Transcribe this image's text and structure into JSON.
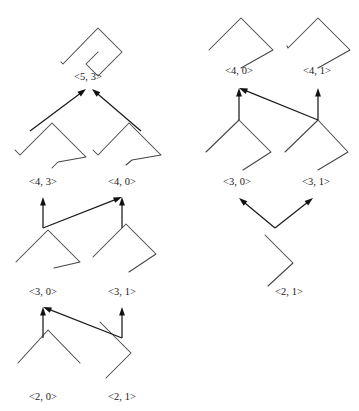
{
  "figure": {
    "kind": "derivation-diagram",
    "background_color": "#ffffff",
    "curve_color": "#454545",
    "arrow_color": "#111111",
    "label_color": "#1a1a1a",
    "columns": [
      {
        "name": "left-column",
        "description": "derivation chain from <2, 0> and <2, 1> up to <5, 3>"
      },
      {
        "name": "right-column",
        "description": "derivation chain from <2, 1> up to <4, 0> and <4, 1>"
      }
    ],
    "nodes": [
      {
        "id": "L53",
        "label": "<5, 3>",
        "label_x": 88,
        "label_y": 80,
        "column": "left",
        "level": 5
      },
      {
        "id": "L43",
        "label": "<4, 3>",
        "label_x": 43,
        "label_y": 185,
        "column": "left",
        "level": 4
      },
      {
        "id": "L40",
        "label": "<4, 0>",
        "label_x": 122,
        "label_y": 185,
        "column": "left",
        "level": 4
      },
      {
        "id": "L30",
        "label": "<3, 0>",
        "label_x": 43,
        "label_y": 295,
        "column": "left",
        "level": 3
      },
      {
        "id": "L31",
        "label": "<3, 1>",
        "label_x": 122,
        "label_y": 295,
        "column": "left",
        "level": 3
      },
      {
        "id": "L20",
        "label": "<2, 0>",
        "label_x": 43,
        "label_y": 400,
        "column": "left",
        "level": 2
      },
      {
        "id": "L21",
        "label": "<2, 1>",
        "label_x": 122,
        "label_y": 400,
        "column": "left",
        "level": 2
      },
      {
        "id": "R40",
        "label": "<4, 0>",
        "label_x": 239,
        "label_y": 74,
        "column": "right",
        "level": 4
      },
      {
        "id": "R41",
        "label": "<4, 1>",
        "label_x": 317,
        "label_y": 74,
        "column": "right",
        "level": 4
      },
      {
        "id": "R30",
        "label": "<3, 0>",
        "label_x": 237,
        "label_y": 185,
        "column": "right",
        "level": 3
      },
      {
        "id": "R31",
        "label": "<3, 1>",
        "label_x": 316,
        "label_y": 185,
        "column": "right",
        "level": 3
      },
      {
        "id": "R21",
        "label": "<2, 1>",
        "label_x": 289,
        "label_y": 295,
        "column": "right",
        "level": 2
      }
    ],
    "curves": [
      {
        "id": "L53",
        "points": "61,62 63,64 98,28 122,52 98,76 86,64 98,52"
      },
      {
        "id": "L43",
        "points": "15,150 20,155 52,123 86,157 58,162 52,168"
      },
      {
        "id": "L40",
        "points": "93,150 98,155 129,123 161,155 132,160 126,165"
      },
      {
        "id": "L30",
        "points": "16,262 48,230 80,262 54,268"
      },
      {
        "id": "L31",
        "points": "93,257 126,224 156,254 129,272"
      },
      {
        "id": "L20",
        "points": "18,363 48,330 80,363"
      },
      {
        "id": "L21",
        "points": "100,322 131,353 106,378"
      },
      {
        "id": "R40",
        "points": "209,50 241,18 273,50 241,68"
      },
      {
        "id": "R41",
        "points": "287,46 288,48 318,18 350,50 318,68"
      },
      {
        "id": "R30",
        "points": "206,152 239,120 271,152 243,170"
      },
      {
        "id": "R31",
        "points": "285,152 318,120 348,152 318,170"
      },
      {
        "id": "R21",
        "points": "265,235 293,263 268,286"
      }
    ],
    "arrows": [
      {
        "id": "a1",
        "from": "L43",
        "to": "L53",
        "path": "30,131 86,89",
        "desc": "left branch into <5, 3>"
      },
      {
        "id": "a2",
        "from": "L40",
        "to": "L53",
        "path": "141,131 92,89",
        "desc": "right branch into <5, 3>"
      },
      {
        "id": "a3",
        "from": "L30",
        "to": "L43",
        "path": "43,228 43,197",
        "desc": "vertical into <4, 3>"
      },
      {
        "id": "a4",
        "from": "L30",
        "to": "L40",
        "path": "43,228 122,197",
        "desc": "diagonal into <4, 0>"
      },
      {
        "id": "a5",
        "from": "L31",
        "to": "L40",
        "path": "122,228 122,197",
        "desc": "vertical into <4, 0>"
      },
      {
        "id": "a6",
        "from": "L20",
        "to": "L30",
        "path": "43,338 43,307",
        "desc": "vertical into <3, 0>"
      },
      {
        "id": "a7",
        "from": "L21",
        "to": "L30",
        "path": "122,338 43,307",
        "desc": "diagonal into <3, 0>"
      },
      {
        "id": "a8",
        "from": "L21",
        "to": "L31",
        "path": "122,338 122,307",
        "desc": "vertical into <3, 1>"
      },
      {
        "id": "a9",
        "from": "R30",
        "to": "R40",
        "path": "239,120 239,88",
        "desc": "vertical into <4, 0>"
      },
      {
        "id": "a10",
        "from": "R31",
        "to": "R40",
        "path": "318,120 239,88",
        "desc": "diagonal into <4, 0>"
      },
      {
        "id": "a11",
        "from": "R31",
        "to": "R41",
        "path": "318,120 318,88",
        "desc": "vertical into <4, 1>"
      },
      {
        "id": "a12",
        "from": "R21",
        "to": "R30",
        "path": "275,228 239,198",
        "desc": "diagonal into <3, 0>"
      },
      {
        "id": "a13",
        "from": "R21",
        "to": "R31",
        "path": "275,228 313,198",
        "desc": "diagonal into <3, 1>"
      }
    ]
  }
}
